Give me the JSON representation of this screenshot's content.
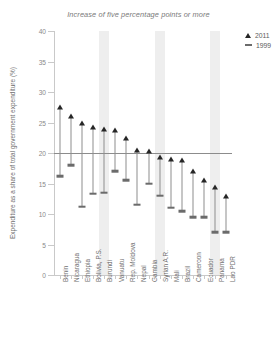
{
  "chart_data": {
    "type": "scatter",
    "title": "Increase of five percentage points or more",
    "xlabel": "",
    "ylabel": "Expenditure as a share of total government expenditure (%)",
    "ylim": [
      0,
      40
    ],
    "yticks": [
      0,
      5,
      10,
      15,
      20,
      25,
      30,
      35,
      40
    ],
    "grid": false,
    "legend_position": "top-right",
    "reference_line": 20,
    "highlight_bands": [
      "Burundi",
      "Syrian A.R.",
      "Panama"
    ],
    "categories": [
      "Benin",
      "Nicaragua",
      "Ethiopia",
      "Bolivia, P.S.",
      "Burundi",
      "Vanuatu",
      "Rep. Moldova",
      "Nepal",
      "Gambia",
      "Syrian A.R.",
      "Mali",
      "Brazil",
      "Cameroon",
      "Ecuador",
      "Panama",
      "Lao PDR"
    ],
    "series": [
      {
        "name": "2011",
        "marker": "triangle",
        "color": "#262626",
        "values": [
          27.5,
          26.0,
          25.0,
          24.2,
          24.0,
          23.7,
          22.5,
          20.5,
          20.3,
          19.3,
          19.0,
          18.8,
          17.0,
          15.5,
          14.5,
          13.0
        ]
      },
      {
        "name": "1999",
        "marker": "dash",
        "color": "#6b6b6b",
        "values": [
          16.2,
          18.0,
          11.2,
          13.3,
          13.5,
          17.0,
          15.5,
          11.5,
          15.0,
          13.0,
          11.0,
          10.5,
          9.5,
          9.5,
          7.0,
          7.0
        ]
      }
    ]
  },
  "legend": {
    "items": [
      {
        "label": "2011",
        "marker": "triangle"
      },
      {
        "label": "1999",
        "marker": "dash"
      }
    ]
  }
}
